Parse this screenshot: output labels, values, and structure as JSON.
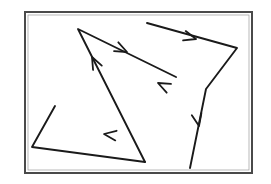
{
  "figure": {
    "title": "Directed polyline figure",
    "description": "Hand-drawn style line drawing of three open directed polyline paths with mid-segment arrowheads, enclosed in a rectangular frame.",
    "canvas": {
      "width": 271,
      "height": 184,
      "background_color": "#ffffff"
    },
    "frame": {
      "name": "bounding-frame",
      "x": 25,
      "y": 12,
      "width": 227,
      "height": 161,
      "stroke_color": "#4a4a4a",
      "stroke_width": 2,
      "fill_color": "#ffffff"
    },
    "line_color": "#1a1a1a",
    "line_width": 1.9,
    "paths": [
      {
        "id": "path-a",
        "name": "upper-right-zigzag-path",
        "label": "Path A",
        "points": [
          [
            147,
            23
          ],
          [
            237,
            48
          ],
          [
            206,
            89
          ],
          [
            190,
            168
          ]
        ],
        "arrows": [
          {
            "at": [
              196,
              39
            ],
            "angle": 15.5,
            "name": "arrow-a1"
          },
          {
            "at": [
              199,
              126
            ],
            "angle": 78.5,
            "name": "arrow-a2"
          }
        ]
      },
      {
        "id": "path-b",
        "name": "central-v-path",
        "label": "Path B",
        "points": [
          [
            145,
            162
          ],
          [
            78,
            29
          ],
          [
            176,
            77
          ]
        ],
        "arrows": [
          {
            "at": [
              92,
              57
            ],
            "angle": 243.3,
            "name": "arrow-b1"
          },
          {
            "at": [
              127,
              52
            ],
            "angle": 26.1,
            "name": "arrow-b2"
          },
          {
            "at": [
              158,
              83
            ],
            "angle": 206.1,
            "name": "arrow-b3"
          }
        ]
      },
      {
        "id": "path-c",
        "name": "lower-left-triangle-path",
        "label": "Path C",
        "points": [
          [
            55,
            106
          ],
          [
            32,
            147
          ],
          [
            145,
            162
          ]
        ],
        "arrows": [
          {
            "at": [
              104,
              134
            ],
            "angle": 187.6,
            "name": "arrow-c1"
          }
        ]
      }
    ],
    "arrow_style": {
      "length": 13,
      "half_angle_deg": 22
    }
  }
}
